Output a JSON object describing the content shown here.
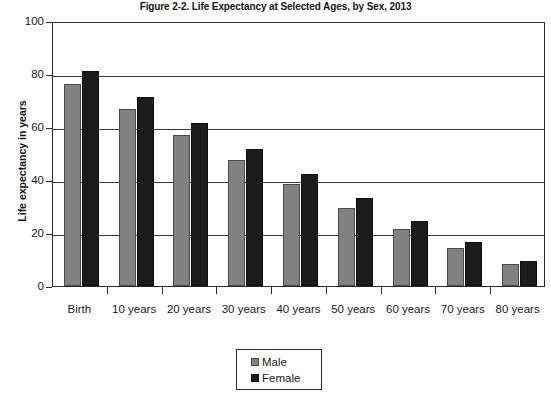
{
  "chart_data": {
    "type": "bar",
    "title": "Figure 2-2. Life Expectancy at Selected Ages, by Sex, 2013",
    "xlabel": "",
    "ylabel": "Life expectancy in years",
    "ylim": [
      0,
      100
    ],
    "ytick_labels": [
      "100",
      "80",
      "60",
      "40",
      "20",
      "0"
    ],
    "ytick_values": [
      100,
      80,
      60,
      40,
      20,
      0
    ],
    "grid": true,
    "legend_position": "bottom-center",
    "categories": [
      "Birth",
      "10 years",
      "20 years",
      "30 years",
      "40 years",
      "50 years",
      "60 years",
      "70 years",
      "80 years"
    ],
    "series": [
      {
        "name": "Male",
        "color": "#828282",
        "values": [
          76.4,
          66.8,
          57.1,
          47.6,
          38.4,
          29.5,
          21.5,
          14.2,
          8.2
        ]
      },
      {
        "name": "Female",
        "color": "#1c1c1c",
        "values": [
          81.2,
          71.3,
          61.5,
          51.8,
          42.3,
          33.1,
          24.5,
          16.6,
          9.6
        ]
      }
    ]
  },
  "legend": {
    "items": [
      {
        "label": "Male",
        "swatch": "male"
      },
      {
        "label": "Female",
        "swatch": "female"
      }
    ]
  }
}
